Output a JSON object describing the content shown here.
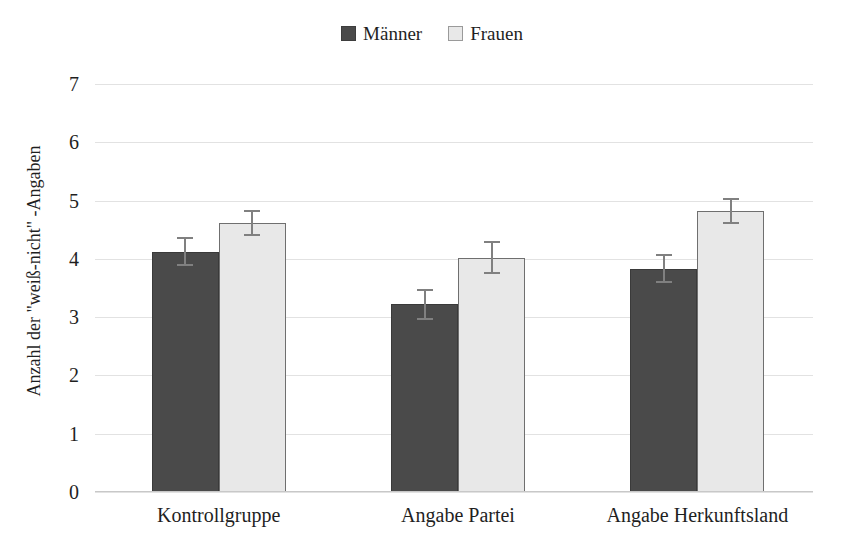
{
  "chart_data": {
    "type": "bar",
    "title": "",
    "xlabel": "",
    "ylabel": "Anzahl der \"weiß-nicht\" -Angaben",
    "ylim": [
      0,
      7
    ],
    "yticks": [
      0,
      1,
      2,
      3,
      4,
      5,
      6,
      7
    ],
    "grid": true,
    "legend_position": "top-center",
    "categories": [
      "Kontrollgruppe",
      "Angabe Partei",
      "Angabe Herkunftsland"
    ],
    "series": [
      {
        "name": "Männer",
        "color": "#4a4a4a",
        "values": [
          4.12,
          3.22,
          3.83
        ],
        "errors": [
          0.25,
          0.27,
          0.25
        ]
      },
      {
        "name": "Frauen",
        "color": "#e8e8e8",
        "values": [
          4.61,
          4.02,
          4.82
        ],
        "errors": [
          0.22,
          0.28,
          0.22
        ]
      }
    ]
  },
  "legend": {
    "entries": [
      {
        "label": "Männer",
        "swatch": "dark-square-icon"
      },
      {
        "label": "Frauen",
        "swatch": "light-square-icon"
      }
    ]
  },
  "axes": {
    "y": {
      "title": "Anzahl der \"weiß-nicht\" -Angaben",
      "ticks": [
        "7",
        "6",
        "5",
        "4",
        "3",
        "2",
        "1",
        "0"
      ]
    },
    "x": {
      "ticks": [
        "Kontrollgruppe",
        "Angabe Partei",
        "Angabe Herkunftsland"
      ]
    }
  },
  "colors": {
    "series_dark": "#4a4a4a",
    "series_light": "#e8e8e8",
    "gridline": "#e2e2e2",
    "text": "#1f1f1f",
    "errorbar": "#808080",
    "background": "#ffffff"
  }
}
